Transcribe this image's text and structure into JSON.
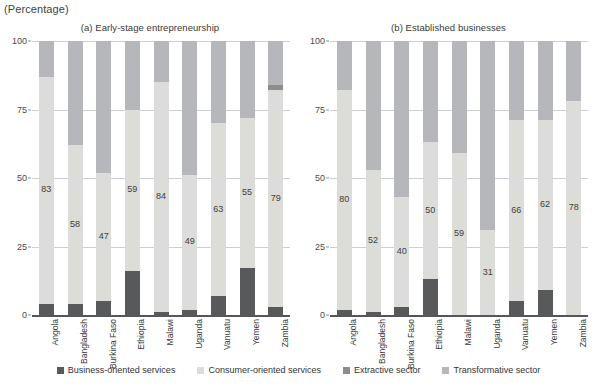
{
  "unit_label": "(Percentage)",
  "legend": {
    "items": [
      {
        "label": "Business-oriented services",
        "color": "#58595b",
        "key": "business"
      },
      {
        "label": "Consumer-oriented services",
        "color": "#dcdcd8",
        "key": "consumer"
      },
      {
        "label": "Extractive sector",
        "color": "#8c8d8f",
        "key": "extractive"
      },
      {
        "label": "Transformative sector",
        "color": "#b6b7ba",
        "key": "transformative"
      }
    ]
  },
  "panels": [
    {
      "id": "a",
      "title": "(a) Early-stage entrepreneurship"
    },
    {
      "id": "b",
      "title": "(b) Established businesses"
    }
  ],
  "yticks": [
    "0",
    "25",
    "50",
    "75",
    "100"
  ],
  "chart_data": [
    {
      "type": "bar",
      "subtype": "stacked-column",
      "title": "(a) Early-stage entrepreneurship",
      "xlabel": "",
      "ylabel": "(Percentage)",
      "ylim": [
        0,
        100
      ],
      "yticks": [
        0,
        25,
        50,
        75,
        100
      ],
      "grid": true,
      "legend_position": "bottom",
      "categories": [
        "Angola",
        "Bangladesh",
        "Burkina Faso",
        "Ethiopia",
        "Malawi",
        "Uganda",
        "Vanuatu",
        "Yemen",
        "Zambia"
      ],
      "series": [
        {
          "name": "Business-oriented services",
          "values": [
            4,
            4,
            5,
            16,
            1,
            2,
            7,
            17,
            3
          ]
        },
        {
          "name": "Consumer-oriented services",
          "values": [
            83,
            58,
            47,
            59,
            84,
            49,
            63,
            55,
            79
          ]
        },
        {
          "name": "Extractive sector",
          "values": [
            0,
            0,
            0,
            0,
            0,
            0,
            0,
            0,
            2
          ]
        },
        {
          "name": "Transformative sector",
          "values": [
            13,
            38,
            48,
            25,
            15,
            49,
            30,
            28,
            16
          ]
        }
      ],
      "data_labels": {
        "series": "Consumer-oriented services",
        "values": [
          83,
          58,
          47,
          59,
          84,
          49,
          63,
          55,
          79
        ]
      }
    },
    {
      "type": "bar",
      "subtype": "stacked-column",
      "title": "(b) Established businesses",
      "xlabel": "",
      "ylabel": "(Percentage)",
      "ylim": [
        0,
        100
      ],
      "yticks": [
        0,
        25,
        50,
        75,
        100
      ],
      "grid": true,
      "legend_position": "bottom",
      "categories": [
        "Angola",
        "Bangladesh",
        "Burkina Faso",
        "Ethiopia",
        "Malawi",
        "Uganda",
        "Vanuatu",
        "Yemen",
        "Zambia"
      ],
      "series": [
        {
          "name": "Business-oriented services",
          "values": [
            2,
            1,
            3,
            13,
            0,
            0,
            5,
            9,
            0
          ]
        },
        {
          "name": "Consumer-oriented services",
          "values": [
            80,
            52,
            40,
            50,
            59,
            31,
            66,
            62,
            78
          ]
        },
        {
          "name": "Extractive sector",
          "values": [
            0,
            0,
            0,
            0,
            0,
            0,
            0,
            0,
            0
          ]
        },
        {
          "name": "Transformative sector",
          "values": [
            18,
            47,
            57,
            37,
            41,
            69,
            29,
            29,
            22
          ]
        }
      ],
      "data_labels": {
        "series": "Consumer-oriented services",
        "values": [
          80,
          52,
          40,
          50,
          59,
          31,
          66,
          62,
          78
        ]
      }
    }
  ]
}
